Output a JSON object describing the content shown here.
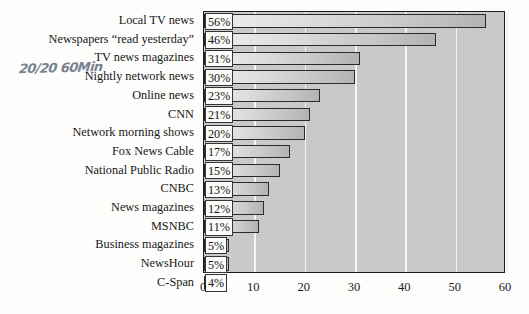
{
  "annotation": {
    "handwritten_note": "20/20 60Min"
  },
  "chart_data": {
    "type": "bar",
    "orientation": "horizontal",
    "title": "",
    "subtitle": "",
    "xlabel": "",
    "ylabel": "",
    "xlim": [
      0,
      60
    ],
    "xticks": [
      0,
      10,
      20,
      30,
      40,
      50,
      60
    ],
    "xtick_labels": [
      "0",
      "10",
      "20",
      "30",
      "40",
      "50",
      "60"
    ],
    "grid": true,
    "grid_axis": "x",
    "legend": false,
    "value_label_suffix": "%",
    "categories": [
      "Local TV news",
      "Newspapers “read yesterday”",
      "TV news magazines",
      "Nightly network news",
      "Online news",
      "CNN",
      "Network morning shows",
      "Fox News Cable",
      "National Public Radio",
      "CNBC",
      "News magazines",
      "MSNBC",
      "Business magazines",
      "NewsHour",
      "C-Span"
    ],
    "values": [
      56,
      46,
      31,
      30,
      23,
      21,
      20,
      17,
      15,
      13,
      12,
      11,
      5,
      5,
      4
    ],
    "value_labels": [
      "56%",
      "46%",
      "31%",
      "30%",
      "23%",
      "21%",
      "20%",
      "17%",
      "15%",
      "13%",
      "12%",
      "11%",
      "5%",
      "5%",
      "4%"
    ],
    "colors": {
      "plot_background": "#c9c9c9",
      "page_background": "#fdfdfc",
      "bar_fill_light": "#eeeeee",
      "bar_fill_dark": "#b3b3b3",
      "bar_outline": "#2a2a2a",
      "gridline": "#f4f4f4",
      "axis_frame": "#1c1c1c",
      "text": "#171717",
      "annotation_ink": "#5b6878"
    }
  }
}
